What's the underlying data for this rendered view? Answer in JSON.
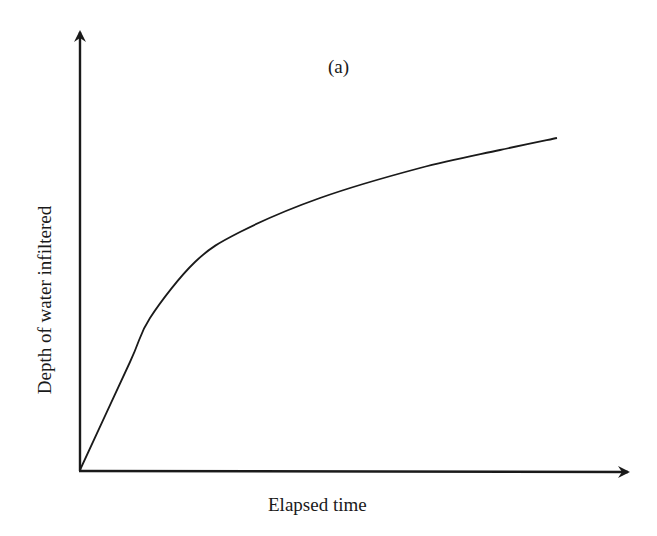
{
  "figure": {
    "panel_label": "(a)",
    "xlabel": "Elapsed time",
    "ylabel": "Depth of water infiltered"
  },
  "chart_data": {
    "type": "line",
    "title": "(a)",
    "xlabel": "Elapsed time",
    "ylabel": "Depth of water infiltered",
    "grid": false,
    "legend": null,
    "axis_ticks": "none (qualitative axes with arrowheads)",
    "series": [
      {
        "name": "Cumulative infiltration",
        "x": [
          0,
          0.09,
          0.13,
          0.21,
          0.29,
          0.43,
          0.6,
          0.8,
          1.0
        ],
        "y": [
          0,
          0.25,
          0.37,
          0.48,
          0.55,
          0.63,
          0.7,
          0.77,
          0.84
        ],
        "note": "Normalized values read from pixel positions; curve rises steeply then flattens (concave)"
      }
    ],
    "pixel_path": [
      [
        80,
        470
      ],
      [
        130,
        362
      ],
      [
        150,
        318
      ],
      [
        195,
        262
      ],
      [
        240,
        232
      ],
      [
        320,
        198
      ],
      [
        420,
        168
      ],
      [
        500,
        150
      ],
      [
        557,
        138
      ]
    ]
  }
}
